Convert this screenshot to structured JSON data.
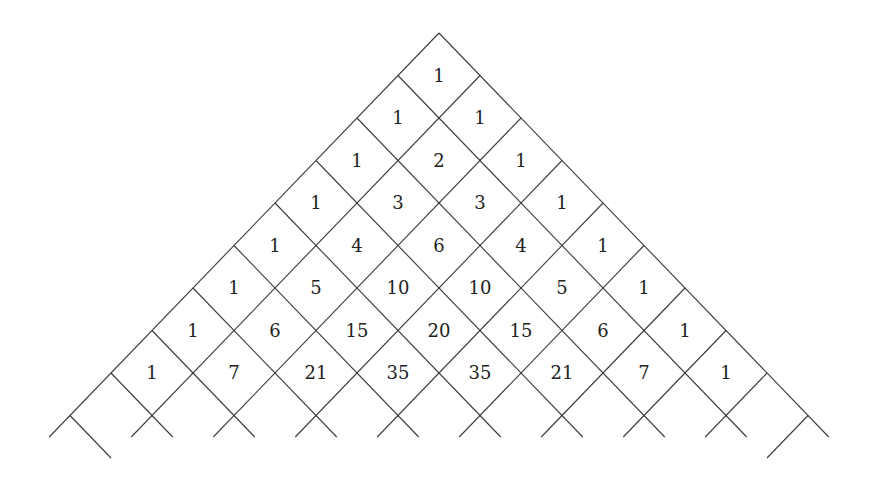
{
  "diagram": {
    "title": "",
    "type": "pascal-triangle-diamond-grid",
    "apex": [
      439,
      33
    ],
    "step_down_left": [
      -41,
      42.5
    ],
    "step_down_right": [
      41,
      42.5
    ],
    "grid_lines_per_family": 10,
    "clip_y": 437,
    "line_color": "#3a3a3a",
    "text_color": "#222222",
    "rows": [
      [
        1
      ],
      [
        1,
        1
      ],
      [
        1,
        2,
        1
      ],
      [
        1,
        3,
        3,
        1
      ],
      [
        1,
        4,
        6,
        4,
        1
      ],
      [
        1,
        5,
        10,
        10,
        5,
        1
      ],
      [
        1,
        6,
        15,
        20,
        15,
        6,
        1
      ],
      [
        1,
        7,
        21,
        35,
        35,
        21,
        7,
        1
      ]
    ]
  }
}
